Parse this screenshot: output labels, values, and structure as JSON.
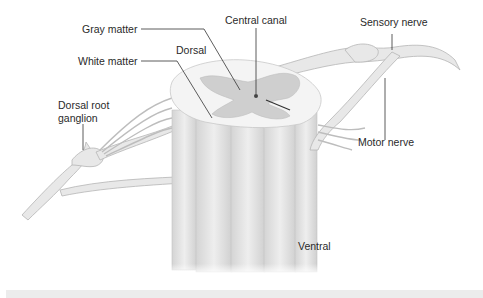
{
  "diagram": {
    "labels": {
      "gray_matter": "Gray matter",
      "central_canal": "Central canal",
      "sensory_nerve": "Sensory nerve",
      "dorsal": "Dorsal",
      "white_matter": "White matter",
      "dorsal_root_ganglion_line1": "Dorsal root",
      "dorsal_root_ganglion_line2": "ganglion",
      "motor_nerve": "Motor nerve",
      "ventral": "Ventral"
    },
    "colors": {
      "background": "#ffffff",
      "nerve_fill": "#e6e6e6",
      "nerve_edge": "#b8b8b8",
      "white_matter": "#f4f4f4",
      "gray_matter": "#cfcfcf",
      "column_fill": "#e2e2e2",
      "leader_line": "#333333",
      "bottom_strip": "#ececec"
    }
  }
}
